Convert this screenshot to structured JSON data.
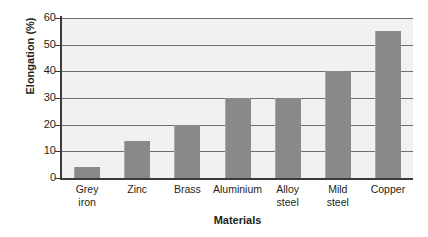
{
  "chart_data": {
    "type": "bar",
    "title": "",
    "xlabel": "Materials",
    "ylabel": "Elongation (%)",
    "categories": [
      "Grey iron",
      "Zinc",
      "Brass",
      "Aluminium",
      "Alloy steel",
      "Mild steel",
      "Copper"
    ],
    "category_lines": [
      [
        "Grey",
        "iron"
      ],
      [
        "Zinc",
        ""
      ],
      [
        "Brass",
        ""
      ],
      [
        "Aluminium",
        ""
      ],
      [
        "Alloy",
        "steel"
      ],
      [
        "Mild",
        "steel"
      ],
      [
        "Copper",
        ""
      ]
    ],
    "values": [
      4,
      14,
      20,
      30,
      30,
      40,
      55
    ],
    "ylim": [
      0,
      60
    ],
    "yticks": [
      0,
      10,
      20,
      30,
      40,
      50,
      60
    ],
    "ytick_labels": [
      "0",
      "10",
      "20",
      "30",
      "40",
      "50",
      "60"
    ],
    "grid": true,
    "grid_axis": "y",
    "legend": false,
    "bar_color": "#898989",
    "plot_background": "#f1f1f0",
    "gridline_color": "#6e6e6e",
    "axis_color": "#3b3b3b",
    "text_color": "#231f20"
  }
}
